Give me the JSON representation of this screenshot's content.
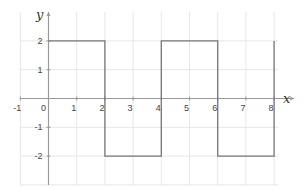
{
  "chart_data": {
    "type": "line",
    "title": "",
    "xlabel": "x",
    "ylabel": "y",
    "xlim": [
      -1,
      8.5
    ],
    "ylim": [
      -3,
      2.9
    ],
    "grid": true,
    "x_ticks": [
      -1,
      0,
      1,
      2,
      3,
      4,
      5,
      6,
      7,
      8
    ],
    "y_ticks": [
      -2,
      -1,
      1,
      2
    ],
    "series": [
      {
        "name": "square wave",
        "color": "#777777",
        "points": [
          [
            0,
            2
          ],
          [
            2,
            2
          ],
          [
            2,
            -2
          ],
          [
            4,
            -2
          ],
          [
            4,
            2
          ],
          [
            6,
            2
          ],
          [
            6,
            -2
          ],
          [
            8,
            -2
          ],
          [
            8,
            2
          ]
        ]
      }
    ]
  },
  "colors": {
    "grid": "#e6e6e6",
    "axis": "#999999",
    "line": "#777777"
  }
}
